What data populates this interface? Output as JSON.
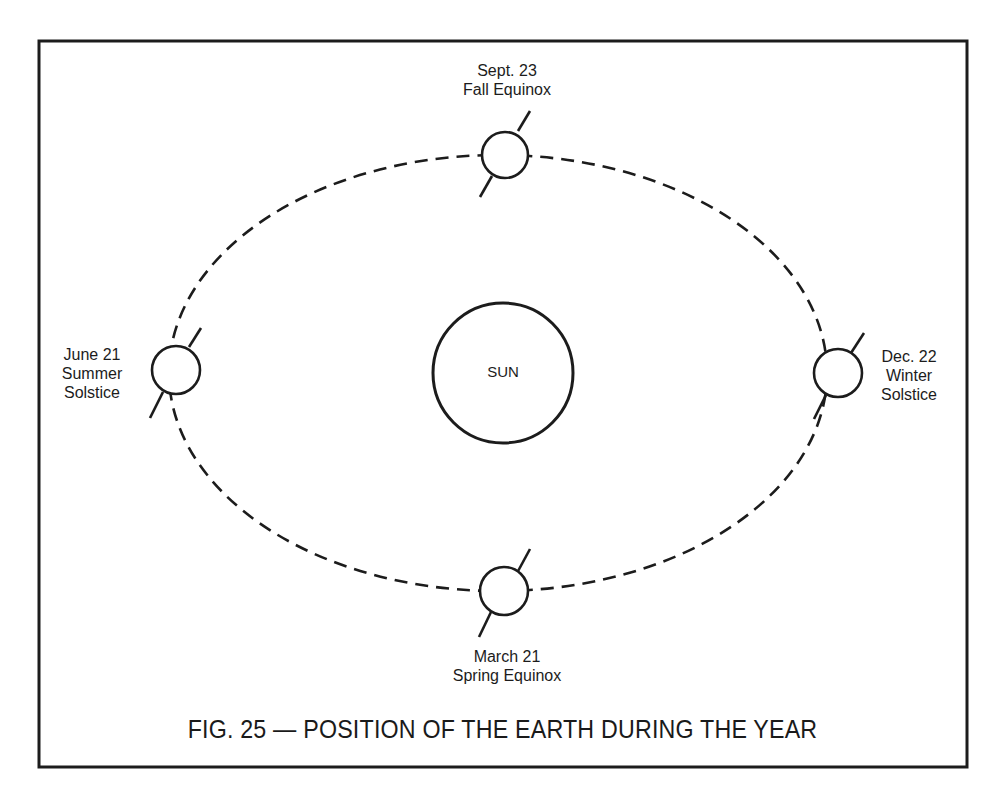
{
  "figure": {
    "caption": "FIG. 25 — POSITION OF THE EARTH DURING THE YEAR",
    "sun_label": "SUN",
    "colors": {
      "ink": "#1c1c1c",
      "background": "#ffffff"
    },
    "positions": [
      {
        "id": "fall-equinox",
        "date": "Sept. 23",
        "name": "Fall Equinox",
        "location": "top"
      },
      {
        "id": "summer-solstice",
        "date": "June 21",
        "name": "Summer",
        "name2": "Solstice",
        "location": "left"
      },
      {
        "id": "winter-solstice",
        "date": "Dec. 22",
        "name": "Winter",
        "name2": "Solstice",
        "location": "right"
      },
      {
        "id": "spring-equinox",
        "date": "March 21",
        "name": "Spring Equinox",
        "location": "bottom"
      }
    ],
    "orbit": {
      "style": "dashed",
      "shape": "ellipse"
    },
    "earth_axis_tilt_deg": 30
  }
}
